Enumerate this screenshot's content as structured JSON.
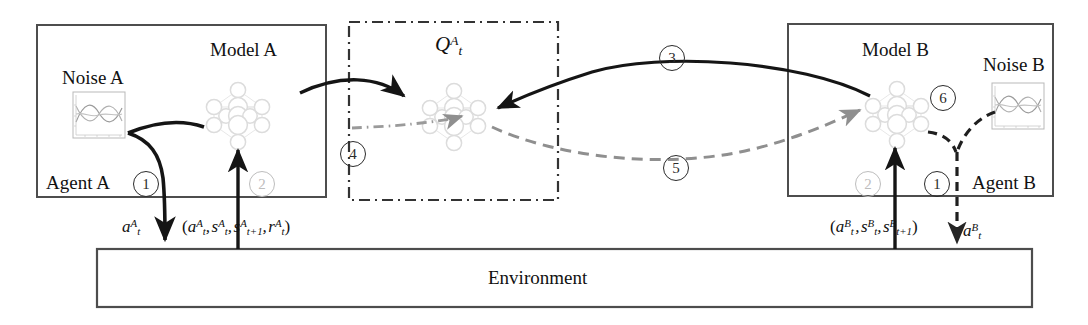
{
  "diagram": {
    "type": "architecture-flow-diagram"
  },
  "agent_a": {
    "box_label": "Agent A",
    "model_label": "Model A",
    "noise_label": "Noise A",
    "action_label": "a",
    "action_sup": "A",
    "action_sub": "t",
    "tuple_text": "(a",
    "step_one": "1",
    "step_two": "2"
  },
  "agent_b": {
    "box_label": "Agent B",
    "model_label": "Model B",
    "noise_label": "Noise B",
    "step_one": "1",
    "step_two": "2",
    "step_six": "6"
  },
  "center": {
    "q_label": "Q",
    "q_sup": "A",
    "q_sub": "t",
    "step_three": "3",
    "step_four": "4",
    "step_five": "5"
  },
  "environment": {
    "label": "Environment"
  },
  "tuples": {
    "a_tuple_parts": [
      "(a",
      "A",
      "t",
      ", s",
      "A",
      "t",
      ", s",
      "A",
      "t+1",
      ", r",
      "A",
      "t",
      ")"
    ],
    "b_tuple_parts": [
      "(a",
      "B",
      "t",
      ", s",
      "B",
      "t",
      ", s",
      "B",
      "t+1",
      ")"
    ]
  },
  "colors": {
    "ink": "#1a1a1a",
    "box_stroke": "#4d4d4d",
    "dash_dot": "#3a3a3a",
    "net_node": "#d9d9d9",
    "net_edge": "#e2e2e2",
    "faint": "#bdbdbd",
    "gray_arrow": "#8a8a8a",
    "dark_arrow": "#1a1a1a"
  },
  "noise_thumbnail": {
    "series_count": 3,
    "description": "three overlapping wavy noise curves in a small framed plot"
  }
}
